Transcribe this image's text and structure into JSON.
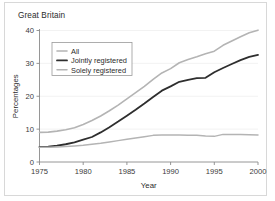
{
  "chart_data": {
    "type": "line",
    "title": "Great Britain",
    "xlabel": "Year",
    "ylabel": "Percentages",
    "xlim": [
      1975,
      2000
    ],
    "ylim": [
      0,
      40
    ],
    "xticks": [
      1975,
      1980,
      1985,
      1990,
      1995,
      2000
    ],
    "yticks": [
      0,
      10,
      20,
      30,
      40
    ],
    "xtick_labels": [
      "1975",
      "1980",
      "1985",
      "1990",
      "1995",
      "2000"
    ],
    "ytick_labels": [
      "0",
      "10",
      "20",
      "30",
      "40"
    ],
    "grid": true,
    "legend_position": "upper-left-inside",
    "x": [
      1975,
      1976,
      1977,
      1978,
      1979,
      1980,
      1981,
      1982,
      1983,
      1984,
      1985,
      1986,
      1987,
      1988,
      1989,
      1990,
      1991,
      1992,
      1993,
      1994,
      1995,
      1996,
      1997,
      1998,
      1999,
      2000
    ],
    "series": [
      {
        "name": "All",
        "color": "#b4b4b4",
        "width": 1.6,
        "values": [
          9.0,
          9.1,
          9.4,
          9.8,
          10.4,
          11.4,
          12.6,
          14.0,
          15.6,
          17.3,
          19.2,
          21.1,
          23.0,
          25.1,
          27.1,
          28.4,
          30.2,
          31.2,
          32.0,
          32.9,
          33.7,
          35.5,
          36.8,
          38.1,
          39.3,
          40.1
        ]
      },
      {
        "name": "Jointly registered",
        "color": "#2e2e2e",
        "width": 1.8,
        "values": [
          4.6,
          4.7,
          5.0,
          5.4,
          6.0,
          6.8,
          7.6,
          9.0,
          10.6,
          12.3,
          14.1,
          15.9,
          17.8,
          19.8,
          21.7,
          23.0,
          24.4,
          25.0,
          25.5,
          25.6,
          27.3,
          28.6,
          29.8,
          31.0,
          32.0,
          32.6
        ]
      },
      {
        "name": "Solely registered",
        "color": "#b4b4b4",
        "width": 1.5,
        "values": [
          4.5,
          4.5,
          4.6,
          4.7,
          4.9,
          5.1,
          5.4,
          5.7,
          6.1,
          6.5,
          6.9,
          7.3,
          7.7,
          8.1,
          8.2,
          8.2,
          8.2,
          8.1,
          8.1,
          7.9,
          7.8,
          8.4,
          8.4,
          8.4,
          8.3,
          8.2
        ]
      }
    ]
  },
  "legend": {
    "items": [
      {
        "label": "All"
      },
      {
        "label": "Jointly registered"
      },
      {
        "label": "Solely registered"
      }
    ]
  }
}
